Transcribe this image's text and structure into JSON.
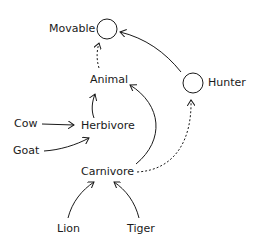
{
  "diagram": {
    "type": "class-hierarchy",
    "colors": {
      "ink": "#1a1a1a",
      "background": "#ffffff"
    },
    "nodes": {
      "movable": {
        "label": "Movable",
        "kind": "interface"
      },
      "hunter": {
        "label": "Hunter",
        "kind": "interface"
      },
      "animal": {
        "label": "Animal",
        "kind": "class"
      },
      "herbivore": {
        "label": "Herbivore",
        "kind": "class"
      },
      "carnivore": {
        "label": "Carnivore",
        "kind": "class"
      },
      "cow": {
        "label": "Cow",
        "kind": "class"
      },
      "goat": {
        "label": "Goat",
        "kind": "class"
      },
      "lion": {
        "label": "Lion",
        "kind": "class"
      },
      "tiger": {
        "label": "Tiger",
        "kind": "class"
      }
    },
    "edges": [
      {
        "from": "Animal",
        "to": "Movable",
        "style": "dashed"
      },
      {
        "from": "Hunter",
        "to": "Movable",
        "style": "solid"
      },
      {
        "from": "Herbivore",
        "to": "Animal",
        "style": "solid"
      },
      {
        "from": "Carnivore",
        "to": "Animal",
        "style": "solid"
      },
      {
        "from": "Carnivore",
        "to": "Hunter",
        "style": "dashed"
      },
      {
        "from": "Cow",
        "to": "Herbivore",
        "style": "solid"
      },
      {
        "from": "Goat",
        "to": "Herbivore",
        "style": "solid"
      },
      {
        "from": "Lion",
        "to": "Carnivore",
        "style": "solid"
      },
      {
        "from": "Tiger",
        "to": "Carnivore",
        "style": "solid"
      }
    ]
  }
}
